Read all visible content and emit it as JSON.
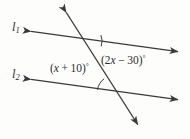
{
  "figure": {
    "type": "geometry-diagram",
    "background_color": "#fdfdfc",
    "stroke_color": "#3a3a3a",
    "text_color": "#2e2e2e",
    "width": 190,
    "height": 139
  },
  "labels": {
    "line_upper": {
      "text": "l",
      "subscript": "1",
      "full_text": "l1"
    },
    "line_lower": {
      "text": "l",
      "subscript": "2",
      "full_text": "l2"
    },
    "angle_upper": {
      "open_paren": "(",
      "coefficient": "2",
      "variable": "x",
      "operator": "−",
      "constant": "30",
      "close_paren": ")",
      "degree": "°",
      "full_text": "(2x − 30)°",
      "expression": "2x - 30"
    },
    "angle_lower": {
      "open_paren": "(",
      "variable": "x",
      "operator": "+",
      "constant": "10",
      "close_paren": ")",
      "degree": "°",
      "full_text": "(x + 10)°",
      "expression": "x + 10"
    }
  },
  "geometry": {
    "line_upper": {
      "x1": 28,
      "y1": 31,
      "x2": 181,
      "y2": 52
    },
    "line_lower": {
      "x1": 28,
      "y1": 79,
      "x2": 181,
      "y2": 100
    },
    "transversal": {
      "x1": 64,
      "y1": 9,
      "x2": 140,
      "y2": 128
    },
    "intersection_upper": {
      "x": 91,
      "y": 45
    },
    "intersection_lower": {
      "x": 113,
      "y": 92
    },
    "arc_upper_radius": 16,
    "arc_lower_radius": 16
  }
}
